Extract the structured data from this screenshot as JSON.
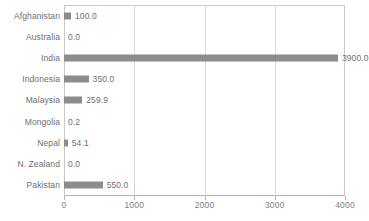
{
  "chart_data": {
    "type": "bar",
    "orientation": "horizontal",
    "title": "",
    "xlabel": "",
    "ylabel": "",
    "categories": [
      "Afghanistan",
      "Australia",
      "India",
      "Indonesia",
      "Malaysia",
      "Mongolia",
      "Nepal",
      "N. Zealand",
      "Pakistan"
    ],
    "values": [
      100.0,
      0.0,
      3900.0,
      350.0,
      259.9,
      0.2,
      54.1,
      0.0,
      550.0
    ],
    "value_labels": [
      "100.0",
      "0.0",
      "3900.0",
      "350.0",
      "259.9",
      "0.2",
      "54.1",
      "0.0",
      "550.0"
    ],
    "xlim": [
      0,
      4000
    ],
    "xticks": [
      0,
      1000,
      2000,
      3000,
      4000
    ],
    "xtick_labels": [
      "0",
      "1000",
      "2000",
      "3000",
      "4000"
    ],
    "grid": true,
    "grid_axis": "x",
    "legend": null,
    "bar_color": "#8c8c8c",
    "grid_color": "#d8d8d8",
    "axis_color": "#b4b4b4",
    "text_color": "#6e6e6e",
    "background": "#ffffff"
  }
}
